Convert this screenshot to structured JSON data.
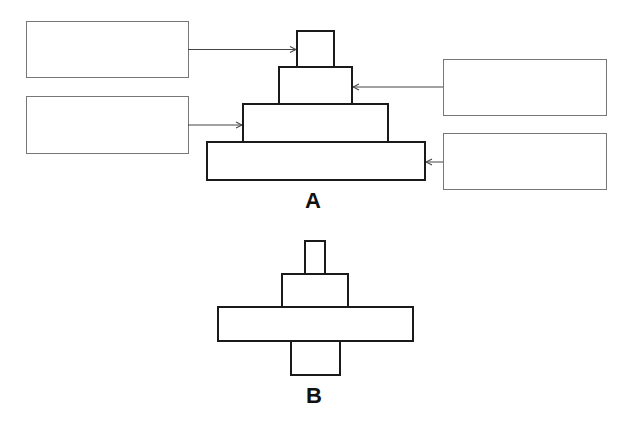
{
  "figure_a": {
    "label": "A",
    "label_boxes": [
      {
        "id": "left-top",
        "text": "",
        "points_to_tier": 1
      },
      {
        "id": "left-bottom",
        "text": "",
        "points_to_tier": 3
      },
      {
        "id": "right-top",
        "text": "",
        "points_to_tier": 2
      },
      {
        "id": "right-bottom",
        "text": "",
        "points_to_tier": 4
      }
    ],
    "tiers": 4
  },
  "figure_b": {
    "label": "B",
    "tiers": 4
  },
  "colors": {
    "stroke": "#1a1a1a",
    "box_stroke": "#777777",
    "arrow": "#444444"
  }
}
